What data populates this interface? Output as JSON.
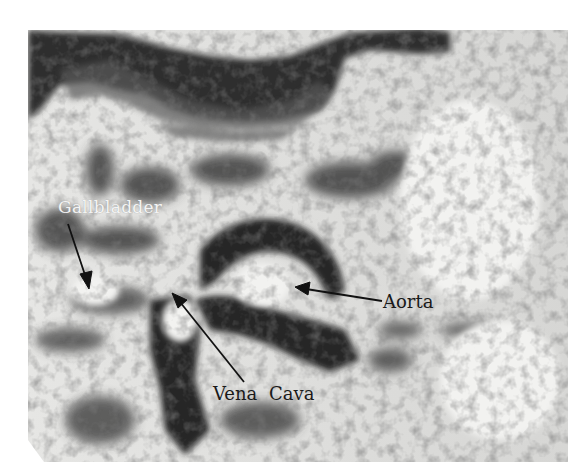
{
  "figure": {
    "labels": [
      {
        "id": "gallbladder",
        "text": "Gallbladder",
        "color": "#f4f4f4"
      },
      {
        "id": "aorta",
        "text": "Aorta",
        "color": "#1a1a1a"
      },
      {
        "id": "vena_cava",
        "text": "Vena Cava",
        "color": "#1a1a1a"
      }
    ]
  },
  "colors": {
    "background": "#ffffff",
    "tissue_light": "#e8e8e6",
    "tissue_dark": "#3a3a3a",
    "arrow": "#111111"
  }
}
